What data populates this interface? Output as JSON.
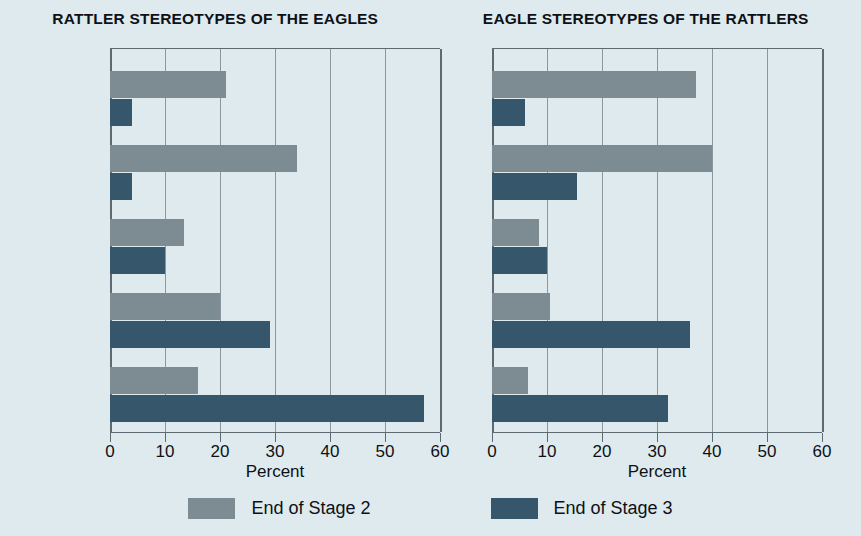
{
  "chart_data": {
    "type": "bar",
    "orientation": "horizontal",
    "title": "",
    "xlabel": "Percent",
    "ylabel": "",
    "xlim": [
      0,
      60
    ],
    "xticks": [
      0,
      10,
      20,
      30,
      40,
      50,
      60
    ],
    "grid": true,
    "legend_position": "bottom",
    "categories": [
      "Very unfavorable",
      "Fairly unfavorable",
      "About 50-50",
      "Fairly favorable",
      "Very favorable"
    ],
    "series_names": [
      "End of Stage 2",
      "End of Stage 3"
    ],
    "colors": {
      "series2": "#7d8b93",
      "series3": "#36566b",
      "background": "#dfeaee",
      "axis": "#5d6a72",
      "grid": "#8b979e"
    },
    "panels": [
      {
        "title": "RATTLER STEREOTYPES OF THE EAGLES",
        "xlabel": "Percent",
        "series": [
          {
            "name": "End of Stage 2",
            "values": [
              21,
              34,
              13.5,
              20,
              16
            ]
          },
          {
            "name": "End of Stage 3",
            "values": [
              4,
              4,
              10,
              29,
              57
            ]
          }
        ]
      },
      {
        "title": "EAGLE STEREOTYPES OF THE RATTLERS",
        "xlabel": "Percent",
        "series": [
          {
            "name": "End of Stage 2",
            "values": [
              37,
              40,
              8.5,
              10.5,
              6.5
            ]
          },
          {
            "name": "End of Stage 3",
            "values": [
              6,
              15.5,
              10,
              36,
              32
            ]
          }
        ]
      }
    ]
  },
  "legend": {
    "items": [
      {
        "label": "End of Stage 2",
        "color": "#7d8b93"
      },
      {
        "label": "End of Stage 3",
        "color": "#36566b"
      }
    ]
  }
}
